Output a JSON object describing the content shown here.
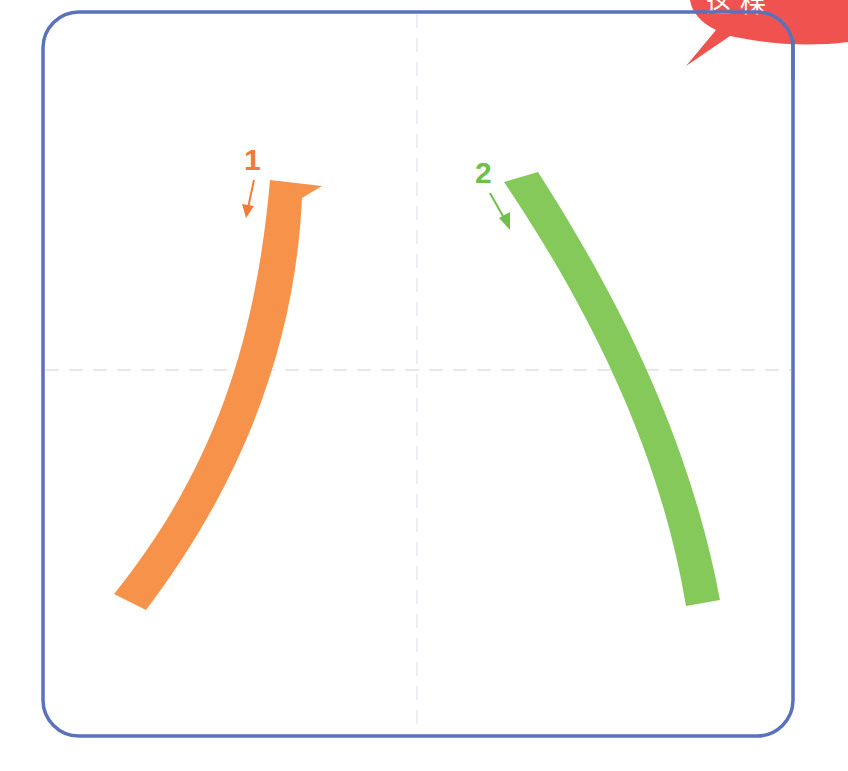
{
  "diagram": {
    "character": "八",
    "frame": {
      "border_color": "#5a72bb",
      "guide_color": "#e4e6ee"
    },
    "banner": {
      "color": "#f0524f",
      "text": "这 棵"
    },
    "strokes": [
      {
        "order": "1",
        "label": "1",
        "name": "pie (left-falling)",
        "color": "#f7924a",
        "direction": "down-left"
      },
      {
        "order": "2",
        "label": "2",
        "name": "na (right-falling)",
        "color": "#84c95a",
        "direction": "down-right"
      }
    ]
  }
}
